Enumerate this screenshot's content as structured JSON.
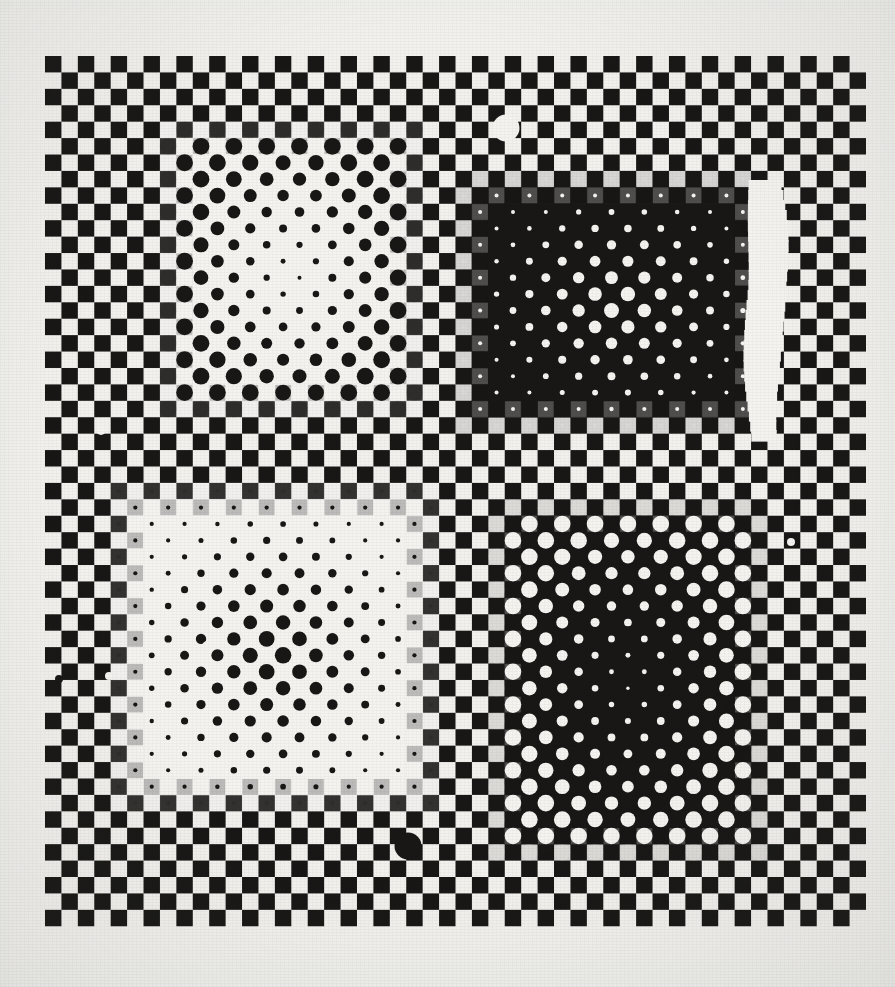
{
  "artwork": {
    "title": "Optical Art Plate — Four Quadrant Dot Matrix",
    "medium": "Screenprint on paper",
    "style": "Op Art / Vasarely-style kinetic composition",
    "canvas": {
      "width": 895,
      "height": 987
    },
    "colors": {
      "paper": "#f2f1ee",
      "paper_edge_shadow": "#e4e2dd",
      "ink_black": "#181715",
      "ink_white": "#f4f3f0"
    },
    "plate": {
      "origin_x": 45,
      "origin_y": 56,
      "cell": 16.42,
      "cols": 50,
      "rows": 53,
      "description": "Black-and-white checkerboard ground; black squares occupy cells where (col+row) is even."
    },
    "motifs": [
      {
        "name": "top-left-shrinking-dark-dots",
        "position": "top-left quadrant",
        "field": "light",
        "dot_color": "#181715",
        "ground_color": "#f4f3f0",
        "col_start": 8,
        "col_end": 21,
        "row_start": 5,
        "row_end": 20,
        "center_col": 14.6,
        "center_row": 12.8,
        "radius_center": 1.6,
        "radius_edge": 8.4,
        "falloff": 1.05,
        "note": "Dark circles on a bleached white field, diminishing toward the centre."
      },
      {
        "name": "top-right-growing-light-dots",
        "position": "top-right quadrant",
        "field": "dark",
        "dot_color": "#f4f3f0",
        "ground_color": "#181715",
        "col_start": 26,
        "col_end": 42,
        "row_start": 8,
        "row_end": 21,
        "center_col": 34.4,
        "center_row": 14.6,
        "radius_center": 7.9,
        "radius_edge": 2.0,
        "falloff": 1.0,
        "note": "White circles on a saturated black field, swelling toward the centre."
      },
      {
        "name": "bottom-left-growing-dark-dots",
        "position": "bottom-left quadrant",
        "field": "light",
        "dot_color": "#181715",
        "ground_color": "#f4f3f0",
        "col_start": 5,
        "col_end": 22,
        "row_start": 27,
        "row_end": 44,
        "center_col": 13.5,
        "center_row": 36.0,
        "radius_center": 8.6,
        "radius_edge": 2.1,
        "falloff": 1.05,
        "note": "Dark circles on white, swelling toward the centre to a near-solid black core."
      },
      {
        "name": "bottom-right-shrinking-light-dots",
        "position": "bottom-right quadrant",
        "field": "dark",
        "dot_color": "#f4f3f0",
        "ground_color": "#181715",
        "col_start": 28,
        "col_end": 42,
        "row_start": 28,
        "row_end": 47,
        "center_col": 35.0,
        "center_row": 37.6,
        "radius_center": 1.5,
        "radius_edge": 8.3,
        "falloff": 1.08,
        "note": "White circles on black, diminishing toward the centre."
      }
    ],
    "artifacts": [
      {
        "name": "white-dot-artifact-top",
        "kind": "circle",
        "tone": "light",
        "x": 506,
        "y": 128,
        "r": 13.5
      },
      {
        "name": "black-dot-artifact-bottom",
        "kind": "circle",
        "tone": "dark",
        "x": 408,
        "y": 846,
        "r": 13.5
      },
      {
        "name": "white-scratch-artifact-right",
        "kind": "blob",
        "tone": "light",
        "x": 765,
        "y": 305,
        "w": 42,
        "h": 250
      },
      {
        "name": "white-speck-left-upper",
        "kind": "speck",
        "tone": "light",
        "x": 101,
        "y": 430,
        "r": 5
      },
      {
        "name": "white-speck-left-lower",
        "kind": "speck",
        "tone": "light",
        "x": 109,
        "y": 676,
        "r": 4
      },
      {
        "name": "white-speck-right-lower",
        "kind": "speck",
        "tone": "light",
        "x": 791,
        "y": 542,
        "r": 4
      },
      {
        "name": "white-ring-speck-bottom-left",
        "kind": "ring",
        "tone": "light",
        "x": 164,
        "y": 525,
        "r": 5
      },
      {
        "name": "white-ring-speck-mid-left",
        "kind": "ring",
        "tone": "light",
        "x": 207,
        "y": 646,
        "r": 4
      },
      {
        "name": "black-speck-lower-left-margin",
        "kind": "speck",
        "tone": "dark",
        "x": 59,
        "y": 679,
        "r": 4
      }
    ]
  }
}
